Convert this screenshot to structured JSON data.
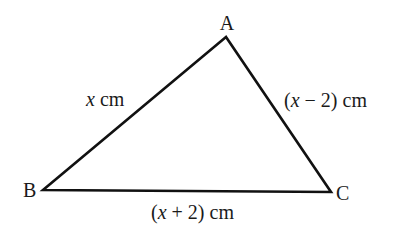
{
  "diagram": {
    "type": "triangle",
    "vertices": {
      "A": {
        "label": "A",
        "x": 226,
        "y": 37
      },
      "B": {
        "label": "B",
        "x": 43,
        "y": 190
      },
      "C": {
        "label": "C",
        "x": 331,
        "y": 192
      }
    },
    "sides": {
      "AB": {
        "var": "x",
        "rest": " cm"
      },
      "AC": {
        "open": "(",
        "var": "x",
        "rest": " − 2) cm"
      },
      "BC": {
        "open": "(",
        "var": "x",
        "rest": " + 2) cm"
      }
    },
    "stroke_color": "#111111"
  }
}
